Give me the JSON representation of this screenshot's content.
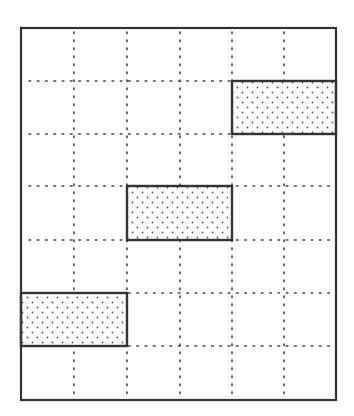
{
  "diagram": {
    "type": "grid-with-shaded-rectangles",
    "grid": {
      "columns": 6,
      "rows": 7,
      "x_lines": [
        21,
        74,
        127,
        180,
        232,
        284,
        336
      ],
      "y_lines": [
        28,
        81,
        134,
        186,
        240,
        293,
        346,
        400
      ],
      "border_color": "#333333",
      "gridline_color": "#444444",
      "gridline_style": "dotted"
    },
    "shaded_rectangles": [
      {
        "name": "top-right-rectangle",
        "col_start": 4,
        "col_end": 6,
        "row_start": 1,
        "row_end": 2
      },
      {
        "name": "middle-rectangle",
        "col_start": 2,
        "col_end": 4,
        "row_start": 3,
        "row_end": 4
      },
      {
        "name": "bottom-left-rectangle",
        "col_start": 0,
        "col_end": 2,
        "row_start": 5,
        "row_end": 6
      }
    ],
    "fill_pattern": "stipple-dots",
    "fill_dot_color": "#555555",
    "rectangle_border_color": "#333333"
  }
}
